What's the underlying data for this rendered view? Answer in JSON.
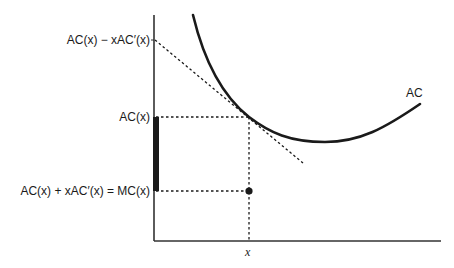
{
  "diagram": {
    "title": "",
    "curve_label": "AC",
    "y_ticks": [
      {
        "label": "AC(x) − xAC′(x)",
        "y": 40
      },
      {
        "label": "AC(x)",
        "y": 117
      },
      {
        "label": "AC(x) + xAC′(x) = MC(x)",
        "y": 191
      }
    ],
    "x_ticks": [
      {
        "label": "x",
        "x": 249
      }
    ],
    "elements": {
      "ac_curve": "U-shaped average cost curve",
      "tangent_line": "dashed tangent to AC at x",
      "guide_lines": "dotted projections from point on curve to axes",
      "marginal_cost_point": "solid dot at (x, MC(x))",
      "difference_bar": "thick bar on y-axis from AC(x) down to MC(x)"
    },
    "colors": {
      "ink": "#1a1a1a",
      "background": "#ffffff"
    }
  }
}
